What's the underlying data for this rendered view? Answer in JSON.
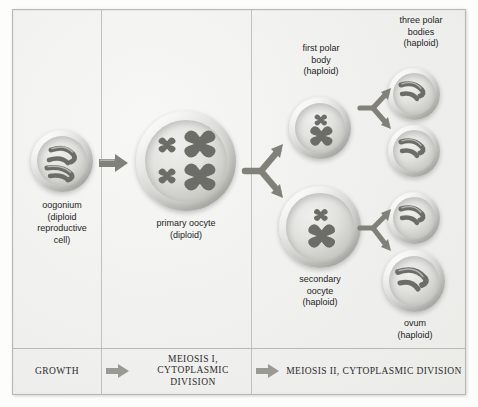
{
  "figure": {
    "background_color": "#f3f3f1",
    "border_color": "#b9b9b5",
    "chromosome_color": "#6d6d68",
    "arrow_color": "#808079"
  },
  "columns": [
    {
      "id": "growth",
      "caption": "GROWTH"
    },
    {
      "id": "meiosis-1",
      "caption": "MEIOSIS I,\nCYTOPLASMIC DIVISION"
    },
    {
      "id": "meiosis-2",
      "caption": "MEIOSIS II,\nCYTOPLASMIC DIVISION"
    }
  ],
  "cells": [
    {
      "id": "oogonium",
      "label": "oogonium\n(diploid\nreproductive\ncell)",
      "label_position": "below",
      "ploidy": "diploid",
      "chromosome_count": 4,
      "chromosome_shape": "curved"
    },
    {
      "id": "primary-oocyte",
      "label": "primary oocyte\n(diploid)",
      "label_position": "below",
      "ploidy": "diploid",
      "chromosome_count": 4,
      "chromosome_shape": "x-shaped"
    },
    {
      "id": "first-polar-body",
      "label": "first polar\nbody\n(haploid)",
      "label_position": "above",
      "ploidy": "haploid",
      "chromosome_count": 2,
      "chromosome_shape": "x-shaped"
    },
    {
      "id": "secondary-oocyte",
      "label": "secondary\noocyte\n(haploid)",
      "label_position": "below",
      "ploidy": "haploid",
      "chromosome_count": 2,
      "chromosome_shape": "x-shaped"
    },
    {
      "id": "polar-body-1",
      "label": "",
      "label_position": "none",
      "ploidy": "haploid",
      "chromosome_count": 2,
      "chromosome_shape": "curved"
    },
    {
      "id": "polar-body-2",
      "label": "",
      "label_position": "none",
      "ploidy": "haploid",
      "chromosome_count": 2,
      "chromosome_shape": "curved"
    },
    {
      "id": "polar-body-3",
      "label": "",
      "label_position": "none",
      "ploidy": "haploid",
      "chromosome_count": 2,
      "chromosome_shape": "curved"
    },
    {
      "id": "ovum",
      "label": "ovum\n(haploid)",
      "label_position": "below",
      "ploidy": "haploid",
      "chromosome_count": 2,
      "chromosome_shape": "curved"
    }
  ],
  "group_labels": [
    {
      "id": "three-polar-bodies",
      "text": "three polar\nbodies\n(haploid)"
    }
  ],
  "arrows": [
    {
      "id": "growth-arrow",
      "type": "straight",
      "from": "oogonium",
      "to": "primary-oocyte"
    },
    {
      "id": "meiosis-1-split",
      "type": "branch",
      "from": "primary-oocyte",
      "to": "first-polar-body, secondary-oocyte"
    },
    {
      "id": "meiosis-2-split-upper",
      "type": "branch",
      "from": "first-polar-body",
      "to": "polar-body-1, polar-body-2"
    },
    {
      "id": "meiosis-2-split-lower",
      "type": "branch",
      "from": "secondary-oocyte",
      "to": "polar-body-3, ovum"
    },
    {
      "id": "caption-arrow-1",
      "type": "straight",
      "from": "growth",
      "to": "meiosis-1"
    },
    {
      "id": "caption-arrow-2",
      "type": "straight",
      "from": "meiosis-1",
      "to": "meiosis-2"
    }
  ]
}
